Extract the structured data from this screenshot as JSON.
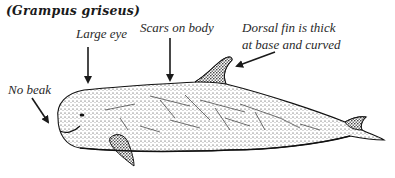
{
  "title": "(Grampus griseus)",
  "labels": {
    "no_beak": "No beak",
    "large_eye": "Large eye",
    "scars": "Scars on body",
    "dorsal_line1": "Dorsal fin is thick",
    "dorsal_line2": "at base and curved"
  },
  "colors": {
    "ink": "#1a1a1a",
    "background": "#ffffff"
  }
}
